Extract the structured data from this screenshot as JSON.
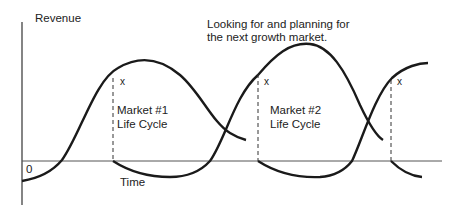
{
  "diagram": {
    "y_axis_label": "Revenue",
    "x_axis_label": "Time",
    "origin_label": "0",
    "annotation_line1": "Looking for and planning for",
    "annotation_line2": "the next growth market.",
    "market1_line1": "Market #1",
    "market1_line2": "Life Cycle",
    "market2_line1": "Market #2",
    "market2_line2": "Life Cycle",
    "marker_1": "x",
    "marker_2": "x",
    "marker_3": "x",
    "line_color": "#1a1a1a"
  }
}
